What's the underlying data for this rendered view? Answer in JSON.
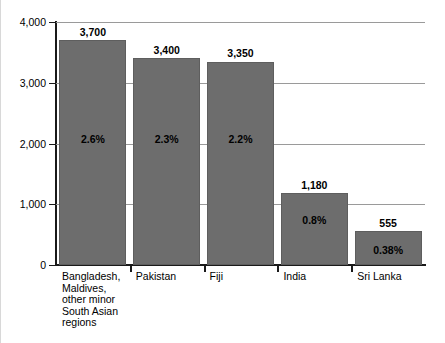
{
  "chart_data": {
    "type": "bar",
    "title": "",
    "xlabel": "",
    "ylabel": "",
    "ylim": [
      0,
      4000
    ],
    "grid": true,
    "legend": "none",
    "yticks": [
      "0",
      "1,000",
      "2,000",
      "3,000",
      "4,000"
    ],
    "ytick_values": [
      0,
      1000,
      2000,
      3000,
      4000
    ],
    "categories": [
      "Bangladesh,\nMaldives,\nother minor\nSouth Asian\nregions",
      "Pakistan",
      "Fiji",
      "India",
      "Sri Lanka"
    ],
    "values": [
      3700,
      3400,
      3350,
      1180,
      555
    ],
    "value_labels": [
      "3,700",
      "3,400",
      "3,350",
      "1,180",
      "555"
    ],
    "percent_labels": [
      "2.6%",
      "2.3%",
      "2.2%",
      "0.8%",
      "0.38%"
    ],
    "percent_values": [
      2.6,
      2.3,
      2.2,
      0.8,
      0.38
    ],
    "colors": {
      "bar_fill": "#6d6d6d",
      "bar_stroke": "#5e5e5e",
      "gridline": "#9a9a9a",
      "axis": "#1a1a1a",
      "text": "#000000",
      "background": "#ffffff"
    }
  }
}
